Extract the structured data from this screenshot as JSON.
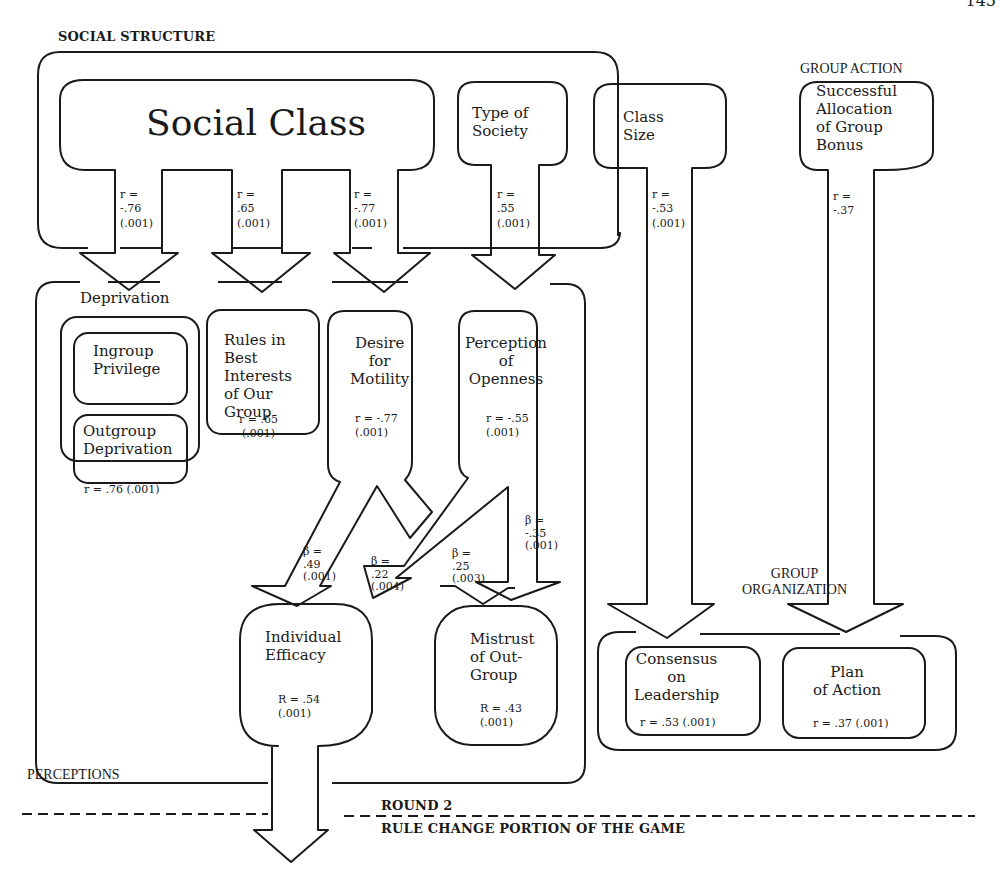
{
  "page_number": "145",
  "sections": {
    "social_structure": "SOCIAL STRUCTURE",
    "group_action": "GROUP ACTION",
    "perceptions": "PERCEPTIONS",
    "group_organization": "GROUP\nORGANIZATION",
    "round": "ROUND 2",
    "round_subtitle": "RULE CHANGE PORTION OF THE GAME"
  },
  "sources": {
    "social_class": {
      "label": "Social Class",
      "links": [
        {
          "target": "Deprivation",
          "stat": "r =\n-.76\n(.001)"
        },
        {
          "target": "Rules in Best Interests of Our Group",
          "stat": "r =\n.65\n(.001)"
        },
        {
          "target": "Desire for Motility",
          "stat": "r =\n-.77\n(.001)"
        }
      ]
    },
    "type_of_society": {
      "label": "Type of\nSociety",
      "stat": "r =\n.55\n(.001)",
      "target": "Perception of Openness"
    },
    "class_size": {
      "label": "Class\nSize",
      "stat": "r =\n-.53\n(.001)",
      "target": "Consensus on Leadership"
    },
    "group_bonus": {
      "label": "Successful\nAllocation\nof Group\nBonus",
      "stat": "r =\n-.37",
      "target": "Plan of Action"
    }
  },
  "perceptions": {
    "deprivation": {
      "title": "Deprivation",
      "items": [
        "Ingroup\nPrivilege",
        "Outgroup\nDeprivation"
      ],
      "stat": "r = .76 (.001)"
    },
    "rules": {
      "label": "Rules in\nBest\nInterests\nof Our\nGroup",
      "stat": "r = .65\n(.001)"
    },
    "motility": {
      "label": "Desire\nfor\nMotility",
      "stat": "r = -.77\n(.001)"
    },
    "openness": {
      "label": "Perception\nof\nOpenness",
      "stat": "r = -.55\n(.001)"
    }
  },
  "paths": [
    {
      "from": "Desire for Motility",
      "to": "Individual Efficacy",
      "stat": "β =\n.49\n(.001)"
    },
    {
      "from": "Perception of Openness",
      "to": "Individual Efficacy",
      "stat": "β =\n.22\n(.004)"
    },
    {
      "from": "Desire for Motility",
      "to": "Mistrust of Out-Group",
      "stat": "β =\n.25\n(.003)"
    },
    {
      "from": "Perception of Openness",
      "to": "Mistrust of Out-Group",
      "stat": "β =\n-.35\n(.001)"
    }
  ],
  "outcomes": {
    "efficacy": {
      "label": "Individual\nEfficacy",
      "stat": "R = .54\n(.001)"
    },
    "mistrust": {
      "label": "Mistrust\nof Out-\nGroup",
      "stat": "R = .43\n(.001)"
    }
  },
  "organization": {
    "consensus": {
      "label": "Consensus\non\nLeadership",
      "stat": "r = .53 (.001)"
    },
    "plan": {
      "label": "Plan\nof Action",
      "stat": "r = .37 (.001)"
    }
  },
  "colors": {
    "ink": "#1a1a1a",
    "background": "#ffffff"
  }
}
